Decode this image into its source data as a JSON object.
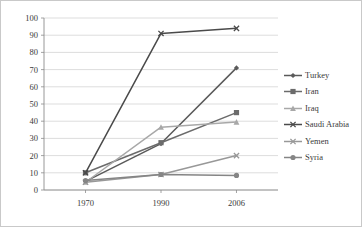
{
  "chart_data": {
    "type": "line",
    "title": "",
    "subtitle": "",
    "xlabel": "",
    "ylabel": "",
    "x": [
      "1970",
      "1990",
      "2006"
    ],
    "categories": [
      "1970",
      "1990",
      "2006"
    ],
    "xtick_labels": [
      "1970",
      "1990",
      "2006"
    ],
    "ytick_labels": [
      "0",
      "10",
      "20",
      "30",
      "40",
      "50",
      "60",
      "70",
      "80",
      "90",
      "100"
    ],
    "ylim": [
      0,
      100
    ],
    "ytick_step": 10,
    "grid": "horizontal",
    "legend_position": "right",
    "series": [
      {
        "name": "Turkey",
        "marker": "diamond",
        "color": "#5a5a5a",
        "values": [
          5,
          27,
          71
        ]
      },
      {
        "name": "Iran",
        "marker": "square",
        "color": "#6b6b6b",
        "values": [
          10,
          27.5,
          45
        ]
      },
      {
        "name": "Iraq",
        "marker": "triangle",
        "color": "#a8a8a8",
        "values": [
          4.5,
          36.5,
          39.5
        ]
      },
      {
        "name": "Saudi Arabia",
        "marker": "cross",
        "color": "#4a4a4a",
        "values": [
          10,
          91,
          94
        ]
      },
      {
        "name": "Yemen",
        "marker": "cross",
        "color": "#989898",
        "values": [
          4.5,
          9,
          20
        ]
      },
      {
        "name": "Syria",
        "marker": "circle",
        "color": "#858585",
        "values": [
          5.5,
          9,
          8.5
        ]
      }
    ]
  },
  "legend": {
    "items": [
      {
        "label": "Turkey"
      },
      {
        "label": "Iran"
      },
      {
        "label": "Iraq"
      },
      {
        "label": "Saudi Arabia"
      },
      {
        "label": "Yemen"
      },
      {
        "label": "Syria"
      }
    ]
  },
  "axes": {
    "y_ticks": [
      "100",
      "90",
      "80",
      "70",
      "60",
      "50",
      "40",
      "30",
      "20",
      "10",
      "0"
    ],
    "x_ticks": [
      "1970",
      "1990",
      "2006"
    ]
  }
}
